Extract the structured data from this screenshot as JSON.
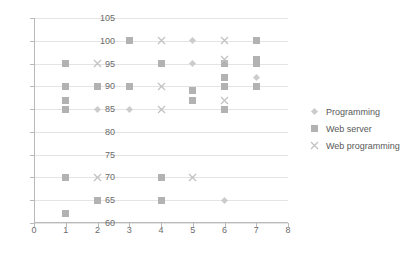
{
  "chart_data": {
    "type": "scatter",
    "title": "",
    "xlabel": "",
    "ylabel": "",
    "xlim": [
      0,
      8
    ],
    "ylim": [
      60,
      105
    ],
    "xticks": [
      "0",
      "1",
      "2",
      "3",
      "4",
      "5",
      "6",
      "7",
      "8"
    ],
    "yticks": [
      "60",
      "65",
      "70",
      "75",
      "80",
      "85",
      "90",
      "95",
      "100",
      "105"
    ],
    "grid": true,
    "legend_position": "right",
    "series": [
      {
        "name": "Programming",
        "marker": "diamond",
        "color": "#cccccc",
        "points": [
          [
            2,
            85
          ],
          [
            3,
            85
          ],
          [
            5,
            100
          ],
          [
            5,
            95
          ],
          [
            6,
            65
          ],
          [
            7,
            92
          ]
        ]
      },
      {
        "name": "Web server",
        "marker": "square",
        "color": "#b2b2b2",
        "points": [
          [
            1,
            95
          ],
          [
            1,
            90
          ],
          [
            1,
            87
          ],
          [
            1,
            85
          ],
          [
            1,
            70
          ],
          [
            1,
            62
          ],
          [
            2,
            90
          ],
          [
            2,
            65
          ],
          [
            3,
            100
          ],
          [
            3,
            90
          ],
          [
            4,
            95
          ],
          [
            4,
            70
          ],
          [
            4,
            65
          ],
          [
            5,
            89
          ],
          [
            5,
            87
          ],
          [
            6,
            95
          ],
          [
            6,
            92
          ],
          [
            6,
            90
          ],
          [
            6,
            85
          ],
          [
            7,
            100
          ],
          [
            7,
            96
          ],
          [
            7,
            95
          ],
          [
            7,
            90
          ]
        ]
      },
      {
        "name": "Web programming",
        "marker": "cross",
        "color": "#c2c2c2",
        "points": [
          [
            2,
            95
          ],
          [
            2,
            70
          ],
          [
            4,
            100
          ],
          [
            4,
            90
          ],
          [
            4,
            85
          ],
          [
            5,
            70
          ],
          [
            6,
            100
          ],
          [
            6,
            96
          ],
          [
            6,
            87
          ]
        ]
      }
    ]
  },
  "legend": {
    "items": [
      {
        "label": "Programming",
        "marker": "diamond-marker"
      },
      {
        "label": "Web server",
        "marker": "square-marker"
      },
      {
        "label": "Web programming",
        "marker": "cross-marker"
      }
    ]
  }
}
